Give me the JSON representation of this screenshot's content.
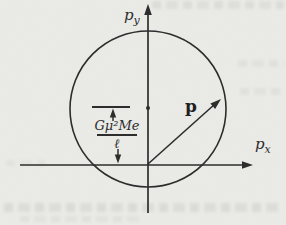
{
  "figure": {
    "axes": {
      "x_label_base": "p",
      "x_label_sub": "x",
      "y_label_base": "p",
      "y_label_sub": "y"
    },
    "vector": {
      "label": "p"
    },
    "annotation": {
      "numerator": "Gμ²Me",
      "denominator": "ℓ"
    },
    "colors": {
      "ink": "#2d2d2d",
      "paper": "#ebebe8"
    }
  }
}
